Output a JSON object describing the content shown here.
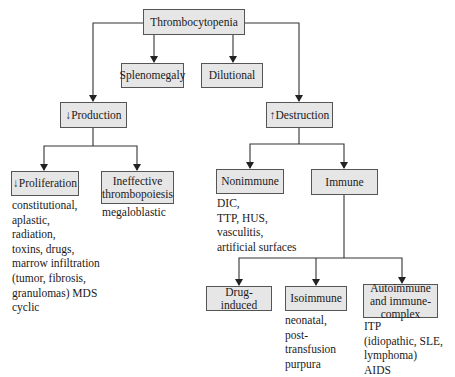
{
  "diagram": {
    "root": "Thrombocytopenia",
    "level1": {
      "splenomegaly": "Splenomegaly",
      "dilutional": "Dilutional",
      "production": "↓Production",
      "destruction": "↑Destruction"
    },
    "production_children": {
      "proliferation": {
        "label": "↓Proliferation",
        "causes": "constitutional,\naplastic,\nradiation,\ntoxins, drugs,\nmarrow infiltration\n(tumor, fibrosis,\ngranulomas) MDS\ncyclic"
      },
      "ineffective": {
        "label": "Ineffective thrombopoiesis",
        "causes": "megaloblastic"
      }
    },
    "destruction_children": {
      "nonimmune": {
        "label": "Nonimmune",
        "causes": "DIC,\nTTP, HUS,\nvasculitis,\nartificial surfaces"
      },
      "immune": {
        "label": "Immune"
      }
    },
    "immune_children": {
      "drug_induced": {
        "label": "Drug-induced"
      },
      "isoimmune": {
        "label": "Isoimmune",
        "causes": "neonatal,\npost-\ntransfusion\npurpura"
      },
      "autoimmune": {
        "label": "Autoimmune and immune-complex",
        "causes": "ITP\n(idiopathic, SLE,\nlymphoma)\nAIDS"
      }
    }
  },
  "colors": {
    "box_fill": "#e6e6e6",
    "line": "#333333"
  }
}
